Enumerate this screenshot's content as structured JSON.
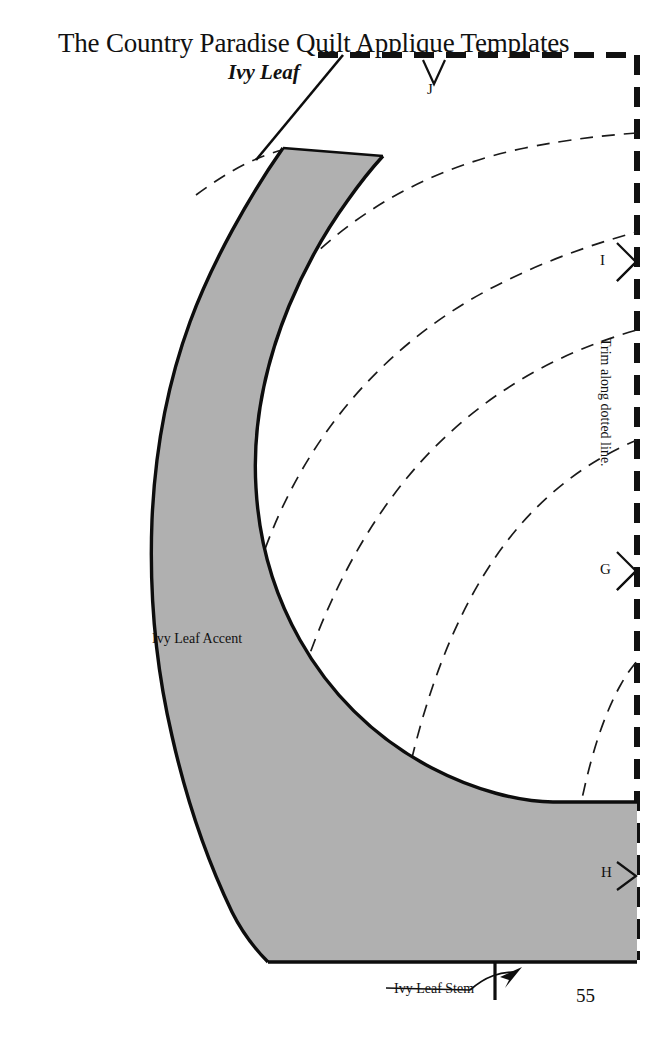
{
  "page": {
    "background_color": "#ffffff",
    "ink_color": "#111111",
    "shape_fill_color": "#b0b0b0",
    "page_number": "55"
  },
  "header": {
    "title": "The Country Paradise Quilt Applique Templates",
    "subtitle": "Ivy Leaf"
  },
  "labels": {
    "accent": "Ivy Leaf Accent",
    "stem": "Ivy Leaf Stem",
    "trim_instruction": "Trim along dotted line."
  },
  "markers": [
    {
      "letter": "J",
      "type": "chevron-down-double",
      "position": "top"
    },
    {
      "letter": "I",
      "type": "chevron-right-double",
      "position": "right-upper"
    },
    {
      "letter": "G",
      "type": "chevron-right-double",
      "position": "right-middle"
    },
    {
      "letter": "H",
      "type": "chevron-right-single",
      "position": "right-lower"
    }
  ],
  "icons": {
    "stem_arrow": "curved-arrow-icon",
    "leader_line": "leader-line-icon"
  },
  "template": {
    "trim_border_style": "thick-dashed",
    "guide_curves_count": 5,
    "guide_curve_style": "thin-dashed",
    "shape_name": "ivy-leaf-crescent"
  }
}
